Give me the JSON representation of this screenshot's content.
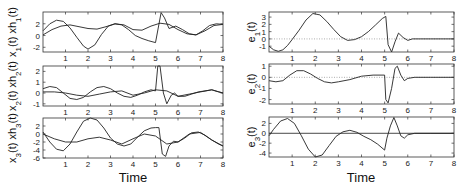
{
  "chart_data": [
    {
      "type": "line",
      "panel": "left-1",
      "ylabel": "x_1(t) xh_1(t)",
      "xlabel": "",
      "xlim": [
        0,
        8
      ],
      "ylim": [
        -2.8,
        4
      ],
      "yticks": [
        -2,
        0,
        2
      ],
      "xticks": [
        1,
        2,
        3,
        4,
        5,
        6,
        7,
        8
      ],
      "series": [
        {
          "name": "x1",
          "x": [
            0,
            0.3,
            0.6,
            0.9,
            1.2,
            1.5,
            1.8,
            2.0,
            2.3,
            2.6,
            2.9,
            3.2,
            3.5,
            3.8,
            4.1,
            4.4,
            4.7,
            5.0,
            5.25,
            5.4,
            5.6,
            5.9,
            6.2,
            6.5,
            6.8,
            7.1,
            7.4,
            7.7,
            8.0
          ],
          "y": [
            0.8,
            2.0,
            2.6,
            2.4,
            1.3,
            -0.3,
            -1.8,
            -2.3,
            -1.6,
            0.2,
            1.6,
            2.0,
            1.8,
            1.0,
            0.0,
            -0.5,
            -0.9,
            -1.2,
            3.9,
            3.0,
            1.2,
            1.6,
            1.0,
            0.3,
            0.1,
            0.8,
            1.7,
            2.0,
            1.9
          ]
        },
        {
          "name": "xh1",
          "x": [
            0,
            0.4,
            0.8,
            1.2,
            1.6,
            2.0,
            2.4,
            2.8,
            3.2,
            3.6,
            4.0,
            4.4,
            4.8,
            5.2,
            5.6,
            6.0,
            6.4,
            6.8,
            7.2,
            7.6,
            8.0
          ],
          "y": [
            0.1,
            1.0,
            1.6,
            1.8,
            1.5,
            1.2,
            1.1,
            1.5,
            2.0,
            1.8,
            1.0,
            0.9,
            1.6,
            2.1,
            1.9,
            1.0,
            0.3,
            0.1,
            0.8,
            1.7,
            1.9
          ]
        }
      ]
    },
    {
      "type": "line",
      "panel": "left-2",
      "ylabel": "x_2(t) xh_2(t)",
      "xlabel": "",
      "xlim": [
        0,
        8
      ],
      "ylim": [
        -1.2,
        2.5
      ],
      "yticks": [
        -1,
        0,
        1,
        2
      ],
      "xticks": [
        1,
        2,
        3,
        4,
        5,
        6,
        7,
        8
      ],
      "series": [
        {
          "name": "x2",
          "x": [
            0,
            0.3,
            0.6,
            0.9,
            1.2,
            1.5,
            1.8,
            2.1,
            2.4,
            2.7,
            3.0,
            3.3,
            3.6,
            3.9,
            4.2,
            4.5,
            4.8,
            5.0,
            5.1,
            5.2,
            5.35,
            5.5,
            5.7,
            5.85,
            6.0,
            6.3,
            6.6,
            6.9,
            7.2,
            7.5,
            7.8,
            8.0
          ],
          "y": [
            0.4,
            0.6,
            0.5,
            0.0,
            -0.5,
            -0.6,
            -0.4,
            0.1,
            0.5,
            0.6,
            0.4,
            0.0,
            -0.3,
            -0.4,
            -0.2,
            0.1,
            0.3,
            0.2,
            2.5,
            2.5,
            0.0,
            -1.0,
            -0.2,
            0.0,
            -0.3,
            -0.3,
            -0.1,
            0.1,
            0.2,
            0.3,
            0.1,
            0.0
          ]
        },
        {
          "name": "xh2",
          "x": [
            0,
            0.5,
            1.0,
            1.5,
            2.0,
            2.5,
            3.0,
            3.5,
            4.0,
            4.5,
            5.0,
            5.5,
            6.0,
            6.5,
            7.0,
            7.5,
            8.0
          ],
          "y": [
            0.1,
            0.1,
            0.0,
            -0.2,
            -0.3,
            -0.1,
            0.1,
            0.2,
            -0.2,
            0.0,
            0.3,
            0.2,
            -0.3,
            -0.1,
            0.1,
            0.3,
            0.0
          ]
        }
      ]
    },
    {
      "type": "line",
      "panel": "left-3",
      "ylabel": "x_3(t) xh_3(t)",
      "xlabel": "Time",
      "xlim": [
        0,
        8
      ],
      "ylim": [
        -6,
        4
      ],
      "yticks": [
        -6,
        -4,
        -2,
        0,
        2
      ],
      "xticks": [
        1,
        2,
        3,
        4,
        5,
        6,
        7,
        8
      ],
      "series": [
        {
          "name": "x3",
          "x": [
            0,
            0.3,
            0.6,
            0.9,
            1.2,
            1.5,
            1.8,
            2.1,
            2.4,
            2.7,
            3.0,
            3.3,
            3.6,
            3.9,
            4.2,
            4.5,
            4.8,
            5.0,
            5.15,
            5.3,
            5.45,
            5.6,
            5.8,
            6.0,
            6.3,
            6.6,
            6.9,
            7.2,
            7.5,
            7.8,
            8.0
          ],
          "y": [
            0.5,
            -2.0,
            -3.8,
            -4.2,
            -2.5,
            0.5,
            3.2,
            4.2,
            3.5,
            1.5,
            -1.0,
            -2.5,
            -3.0,
            -2.5,
            -0.8,
            0.8,
            1.5,
            1.6,
            1.6,
            -5.0,
            -5.6,
            -3.0,
            -1.8,
            -2.0,
            -1.0,
            0.3,
            0.5,
            -0.3,
            -1.5,
            -2.5,
            -3.0
          ]
        },
        {
          "name": "xh3",
          "x": [
            0,
            0.5,
            1.0,
            1.5,
            2.0,
            2.5,
            3.0,
            3.5,
            4.0,
            4.5,
            5.0,
            5.5,
            6.0,
            6.5,
            7.0,
            7.5,
            8.0
          ],
          "y": [
            0.0,
            -1.2,
            -2.0,
            -2.0,
            -1.2,
            -0.8,
            -1.5,
            -2.5,
            -1.2,
            0.0,
            -0.5,
            -2.5,
            -2.0,
            0.0,
            0.4,
            -1.5,
            -3.0
          ]
        }
      ]
    },
    {
      "type": "line",
      "panel": "right-1",
      "ylabel": "e_1(t)",
      "xlabel": "",
      "xlim": [
        0,
        8
      ],
      "ylim": [
        -1.8,
        3.7
      ],
      "yticks": [
        -1,
        0,
        1,
        2,
        3
      ],
      "xticks": [
        1,
        2,
        3,
        4,
        5,
        6,
        7,
        8
      ],
      "zero_line": "dotted",
      "series": [
        {
          "name": "e1",
          "x": [
            0,
            0.2,
            0.4,
            0.6,
            0.8,
            1.0,
            1.3,
            1.6,
            1.9,
            2.2,
            2.5,
            2.8,
            3.1,
            3.4,
            3.7,
            4.0,
            4.3,
            4.6,
            4.9,
            5.05,
            5.15,
            5.3,
            5.45,
            5.6,
            5.8,
            6.0,
            6.2,
            6.5,
            7.0,
            8.0
          ],
          "y": [
            -1.0,
            -1.5,
            -1.7,
            -1.5,
            -0.9,
            -0.1,
            1.2,
            2.6,
            3.5,
            3.3,
            2.4,
            1.3,
            0.3,
            -0.2,
            -0.1,
            0.3,
            1.0,
            1.9,
            2.8,
            3.1,
            -0.8,
            -1.8,
            -0.4,
            0.8,
            0.2,
            -0.2,
            0.0,
            0.0,
            0.0,
            0.0
          ]
        }
      ]
    },
    {
      "type": "line",
      "panel": "right-2",
      "ylabel": "e_2(t)",
      "xlabel": "",
      "xlim": [
        0,
        8
      ],
      "ylim": [
        -2.4,
        1.2
      ],
      "yticks": [
        -2,
        -1,
        0,
        1
      ],
      "xticks": [
        1,
        2,
        3,
        4,
        5,
        6,
        7,
        8
      ],
      "zero_line": "dotted",
      "series": [
        {
          "name": "e2",
          "x": [
            0,
            0.3,
            0.6,
            0.9,
            1.2,
            1.5,
            1.8,
            2.1,
            2.4,
            2.7,
            3.0,
            3.5,
            4.0,
            4.5,
            5.0,
            5.05,
            5.15,
            5.3,
            5.45,
            5.55,
            5.7,
            5.85,
            6.0,
            6.3,
            7.0,
            8.0
          ],
          "y": [
            -0.3,
            -0.4,
            -0.3,
            0.2,
            0.6,
            0.6,
            0.3,
            -0.1,
            -0.4,
            -0.5,
            -0.4,
            -0.2,
            0.1,
            0.2,
            0.2,
            -2.0,
            -2.3,
            -1.0,
            0.8,
            1.0,
            0.2,
            -0.3,
            -0.1,
            0.0,
            0.0,
            0.0
          ]
        }
      ]
    },
    {
      "type": "line",
      "panel": "right-3",
      "ylabel": "e_3(t)",
      "xlabel": "Time",
      "xlim": [
        0,
        8
      ],
      "ylim": [
        -4.8,
        3.3
      ],
      "yticks": [
        -4,
        -2,
        0,
        2
      ],
      "xticks": [
        1,
        2,
        3,
        4,
        5,
        6,
        7,
        8
      ],
      "zero_line": "solid",
      "series": [
        {
          "name": "e3",
          "x": [
            0,
            0.2,
            0.5,
            0.8,
            1.1,
            1.4,
            1.7,
            2.0,
            2.3,
            2.6,
            2.9,
            3.2,
            3.5,
            3.8,
            4.1,
            4.4,
            4.7,
            5.0,
            5.1,
            5.25,
            5.4,
            5.55,
            5.7,
            5.85,
            6.0,
            6.3,
            7.0,
            8.0
          ],
          "y": [
            -0.5,
            0.8,
            2.5,
            3.0,
            2.0,
            -0.5,
            -3.2,
            -4.8,
            -4.4,
            -2.5,
            -0.6,
            0.3,
            0.6,
            0.2,
            -0.6,
            -1.3,
            -2.2,
            -3.4,
            -1.0,
            1.5,
            3.2,
            1.5,
            -0.5,
            -1.0,
            -0.3,
            0.0,
            0.0,
            0.0
          ]
        }
      ]
    }
  ],
  "labels": {
    "left": [
      "x_1(t) xh_1(t)",
      "x_2(t) xh_2(t)",
      "x_3(t) xh_3(t)"
    ],
    "right": [
      "e_1(t)",
      "e_2(t)",
      "e_3(t)"
    ],
    "time": "Time"
  }
}
